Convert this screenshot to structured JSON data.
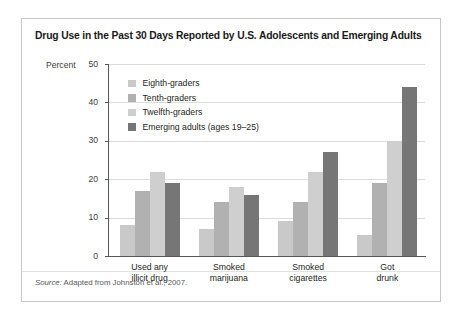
{
  "figure": {
    "title": "Drug Use in the Past 30 Days Reported by U.S. Adolescents and Emerging Adults",
    "source_prefix": "Source:",
    "source_text": " Adapted from Johnston et al., 2007."
  },
  "axis": {
    "y_axis_title": "Percent",
    "y_ticks": [
      "0",
      "10",
      "20",
      "30",
      "40",
      "50"
    ]
  },
  "legend": {
    "items": [
      {
        "label": "Eighth-graders",
        "color": "#c9c9c9"
      },
      {
        "label": "Tenth-graders",
        "color": "#b1b1b1"
      },
      {
        "label": "Twelfth-graders",
        "color": "#cfcfcf"
      },
      {
        "label": "Emerging adults (ages 19–25)",
        "color": "#767676"
      }
    ]
  },
  "chart_data": {
    "type": "bar",
    "title": "Drug Use in the Past 30 Days Reported by U.S. Adolescents and Emerging Adults",
    "xlabel": "",
    "ylabel": "Percent",
    "ylim": [
      0,
      50
    ],
    "yticks": [
      0,
      10,
      20,
      30,
      40,
      50
    ],
    "grid": true,
    "legend_position": "upper-left-inside",
    "categories": [
      "Used any illicit drug",
      "Smoked marijuana",
      "Smoked cigarettes",
      "Got drunk"
    ],
    "category_lines": [
      [
        "Used any",
        "illicit drug"
      ],
      [
        "Smoked",
        "marijuana"
      ],
      [
        "Smoked",
        "cigarettes"
      ],
      [
        "Got",
        "drunk"
      ]
    ],
    "series": [
      {
        "name": "Eighth-graders",
        "color": "#c9c9c9",
        "values": [
          8,
          7,
          9,
          5.5
        ]
      },
      {
        "name": "Tenth-graders",
        "color": "#b1b1b1",
        "values": [
          17,
          14,
          14,
          19
        ]
      },
      {
        "name": "Twelfth-graders",
        "color": "#cfcfcf",
        "values": [
          22,
          18,
          22,
          30
        ]
      },
      {
        "name": "Emerging adults (ages 19–25)",
        "color": "#767676",
        "values": [
          19,
          16,
          27,
          44
        ]
      }
    ]
  }
}
